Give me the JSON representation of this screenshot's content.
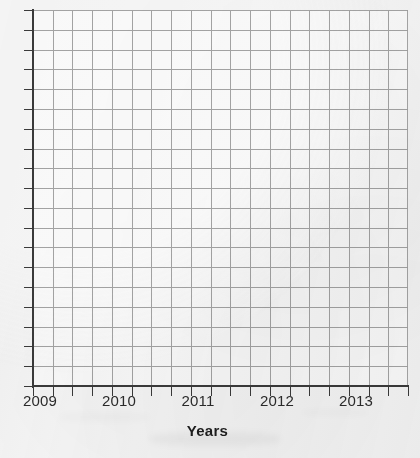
{
  "chart_data": {
    "type": "line",
    "title": "",
    "subtitle": "",
    "xlabel": "Years",
    "ylabel": "",
    "series": [],
    "x": [
      2009,
      2010,
      2011,
      2012,
      2013
    ],
    "xtick_labels": [
      "2009",
      "2010",
      "2011",
      "2012",
      "2013"
    ],
    "ytick_labels": [],
    "xlim": [
      2009,
      2013.75
    ],
    "grid": true,
    "grid_columns": 19,
    "grid_rows": 19,
    "legend": "none",
    "annotations": [],
    "note": "Blank grid / empty plotting template: axes and gridlines drawn, no data plotted"
  },
  "axes": {
    "x_axis": {
      "name": "x-axis",
      "title": "Years",
      "tick_labels": [
        "2009",
        "2010",
        "2011",
        "2012",
        "2013"
      ],
      "tick_label_positions_px": [
        40,
        119,
        198,
        277,
        356
      ],
      "minor_tick_count": 19
    },
    "y_axis": {
      "name": "y-axis",
      "title": "",
      "tick_labels": [],
      "minor_tick_count": 19
    }
  },
  "style": {
    "paper_color": "#f4f4f4",
    "grid_color": "#9d9d9d",
    "axis_color": "#3a3a3a",
    "label_color": "#2b2b2b",
    "title_color": "#1f1f1f"
  }
}
